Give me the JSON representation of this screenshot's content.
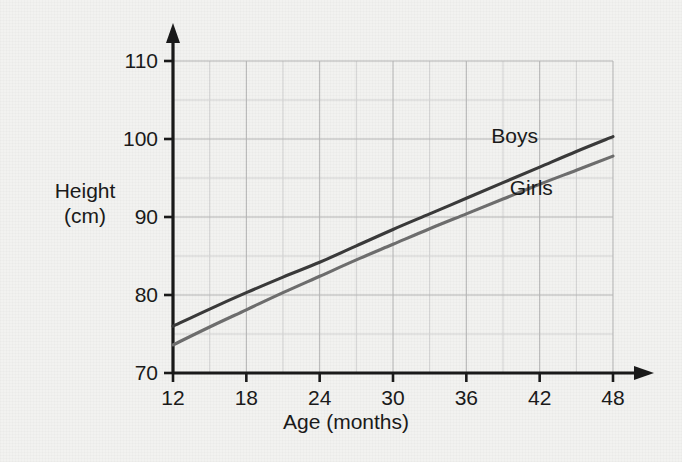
{
  "chart_data": {
    "type": "line",
    "title": "",
    "xlabel": "Age (months)",
    "ylabel": "Height (cm)",
    "ylabel_lines": [
      "Height",
      "(cm)"
    ],
    "xlim": [
      12,
      48
    ],
    "ylim": [
      70,
      110
    ],
    "x_ticks": [
      12,
      18,
      24,
      30,
      36,
      42,
      48
    ],
    "y_ticks": [
      70,
      80,
      90,
      100,
      110
    ],
    "x_minor_step": 3,
    "y_minor_step": 5,
    "grid": true,
    "legend_position": "inline-annotation",
    "series": [
      {
        "name": "Boys",
        "color": "#3a3a3a",
        "label_x": 40.5,
        "label_y": 100.3,
        "x": [
          12,
          15,
          18,
          21,
          24,
          27,
          30,
          33,
          36,
          39,
          42,
          45,
          48
        ],
        "values": [
          76.0,
          78.2,
          80.3,
          82.3,
          84.2,
          86.3,
          88.4,
          90.4,
          92.4,
          94.4,
          96.4,
          98.4,
          100.3
        ]
      },
      {
        "name": "Girls",
        "color": "#6e6e6e",
        "label_x": 42.0,
        "label_y": 93.6,
        "x": [
          12,
          15,
          18,
          21,
          24,
          27,
          30,
          33,
          36,
          39,
          42,
          45,
          48
        ],
        "values": [
          73.6,
          75.9,
          78.1,
          80.3,
          82.4,
          84.5,
          86.5,
          88.5,
          90.4,
          92.3,
          94.2,
          96.0,
          97.8
        ]
      }
    ]
  },
  "colors": {
    "background": "#f2f2f0",
    "axis": "#1a1a1a",
    "gridline_major": "#b4b4b4",
    "gridline_minor": "#d2d2d2",
    "text": "#1a1a1a",
    "boys": "#3a3a3a",
    "girls": "#6e6e6e"
  },
  "icons": {
    "y_axis_arrow": "arrow-up-icon",
    "x_axis_arrow": "arrow-right-icon"
  }
}
